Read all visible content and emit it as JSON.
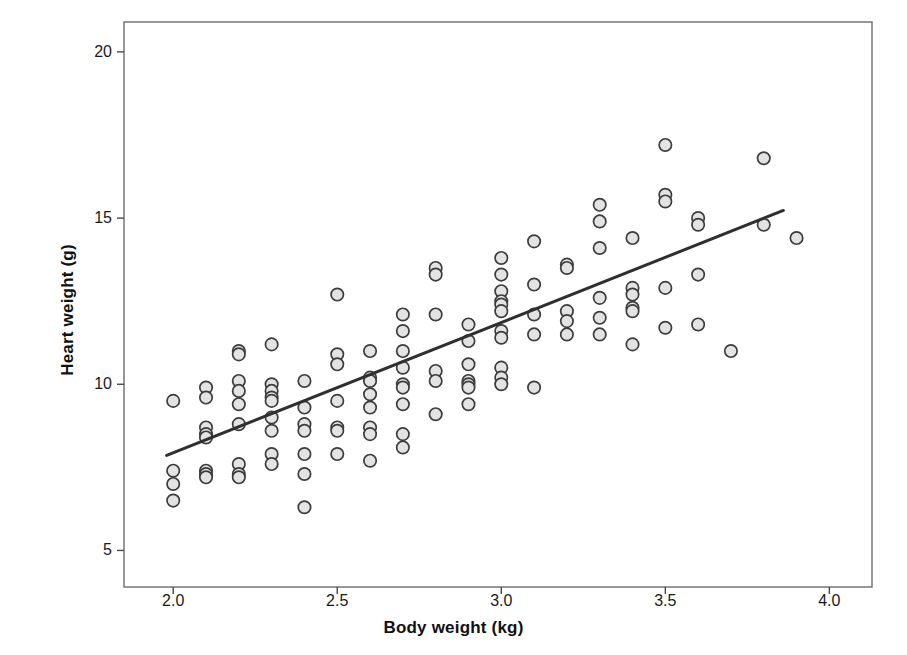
{
  "chart_data": {
    "type": "scatter",
    "title": "",
    "xlabel": "Body weight (kg)",
    "ylabel": "Heart weight (g)",
    "xlim": [
      1.85,
      4.13
    ],
    "ylim": [
      3.9,
      20.9
    ],
    "xticks": [
      "2.0",
      "2.5",
      "3.0",
      "3.5",
      "4.0"
    ],
    "xtick_values": [
      2.0,
      2.5,
      3.0,
      3.5,
      4.0
    ],
    "yticks": [
      "5",
      "10",
      "15",
      "20"
    ],
    "ytick_values": [
      5,
      10,
      15,
      20
    ],
    "grid": false,
    "legend": "none",
    "marker": {
      "shape": "circle",
      "fill": "#e3e3e3",
      "edge": "#3c3c3c",
      "radius": 6.2
    },
    "series": [
      {
        "name": "Cats: body weight vs heart weight",
        "points": [
          [
            2.0,
            9.5
          ],
          [
            2.0,
            7.4
          ],
          [
            2.0,
            7.0
          ],
          [
            2.0,
            6.5
          ],
          [
            2.1,
            9.9
          ],
          [
            2.1,
            9.6
          ],
          [
            2.1,
            8.7
          ],
          [
            2.1,
            8.5
          ],
          [
            2.1,
            8.4
          ],
          [
            2.1,
            7.4
          ],
          [
            2.1,
            7.3
          ],
          [
            2.1,
            7.2
          ],
          [
            2.2,
            11.0
          ],
          [
            2.2,
            10.9
          ],
          [
            2.2,
            10.1
          ],
          [
            2.2,
            9.8
          ],
          [
            2.2,
            9.4
          ],
          [
            2.2,
            8.8
          ],
          [
            2.2,
            7.6
          ],
          [
            2.2,
            7.3
          ],
          [
            2.2,
            7.2
          ],
          [
            2.3,
            11.2
          ],
          [
            2.3,
            10.0
          ],
          [
            2.3,
            9.8
          ],
          [
            2.3,
            9.6
          ],
          [
            2.3,
            9.5
          ],
          [
            2.3,
            9.0
          ],
          [
            2.3,
            8.6
          ],
          [
            2.3,
            7.9
          ],
          [
            2.3,
            7.6
          ],
          [
            2.4,
            10.1
          ],
          [
            2.4,
            9.3
          ],
          [
            2.4,
            8.8
          ],
          [
            2.4,
            8.6
          ],
          [
            2.4,
            7.9
          ],
          [
            2.4,
            7.3
          ],
          [
            2.4,
            6.3
          ],
          [
            2.5,
            12.7
          ],
          [
            2.5,
            10.9
          ],
          [
            2.5,
            10.6
          ],
          [
            2.5,
            9.5
          ],
          [
            2.5,
            8.7
          ],
          [
            2.5,
            8.6
          ],
          [
            2.5,
            7.9
          ],
          [
            2.6,
            11.0
          ],
          [
            2.6,
            10.2
          ],
          [
            2.6,
            10.1
          ],
          [
            2.6,
            9.7
          ],
          [
            2.6,
            9.3
          ],
          [
            2.6,
            8.7
          ],
          [
            2.6,
            8.5
          ],
          [
            2.6,
            7.7
          ],
          [
            2.7,
            12.1
          ],
          [
            2.7,
            11.6
          ],
          [
            2.7,
            11.0
          ],
          [
            2.7,
            10.5
          ],
          [
            2.7,
            10.0
          ],
          [
            2.7,
            9.9
          ],
          [
            2.7,
            9.4
          ],
          [
            2.7,
            8.5
          ],
          [
            2.7,
            8.1
          ],
          [
            2.8,
            13.5
          ],
          [
            2.8,
            13.3
          ],
          [
            2.8,
            12.1
          ],
          [
            2.8,
            10.4
          ],
          [
            2.8,
            10.1
          ],
          [
            2.8,
            9.1
          ],
          [
            2.9,
            11.8
          ],
          [
            2.9,
            11.3
          ],
          [
            2.9,
            10.6
          ],
          [
            2.9,
            10.1
          ],
          [
            2.9,
            10.0
          ],
          [
            2.9,
            9.9
          ],
          [
            2.9,
            9.4
          ],
          [
            3.0,
            13.8
          ],
          [
            3.0,
            13.3
          ],
          [
            3.0,
            12.8
          ],
          [
            3.0,
            12.5
          ],
          [
            3.0,
            12.4
          ],
          [
            3.0,
            12.2
          ],
          [
            3.0,
            11.6
          ],
          [
            3.0,
            11.4
          ],
          [
            3.0,
            10.5
          ],
          [
            3.0,
            10.2
          ],
          [
            3.0,
            10.0
          ],
          [
            3.1,
            14.3
          ],
          [
            3.1,
            13.0
          ],
          [
            3.1,
            12.1
          ],
          [
            3.1,
            11.5
          ],
          [
            3.1,
            9.9
          ],
          [
            3.2,
            13.6
          ],
          [
            3.2,
            13.5
          ],
          [
            3.2,
            12.2
          ],
          [
            3.2,
            11.9
          ],
          [
            3.2,
            11.5
          ],
          [
            3.3,
            15.4
          ],
          [
            3.3,
            14.9
          ],
          [
            3.3,
            14.1
          ],
          [
            3.3,
            12.6
          ],
          [
            3.3,
            12.0
          ],
          [
            3.3,
            11.5
          ],
          [
            3.4,
            14.4
          ],
          [
            3.4,
            12.9
          ],
          [
            3.4,
            12.7
          ],
          [
            3.4,
            12.3
          ],
          [
            3.4,
            12.2
          ],
          [
            3.4,
            11.2
          ],
          [
            3.5,
            17.2
          ],
          [
            3.5,
            15.7
          ],
          [
            3.5,
            15.5
          ],
          [
            3.5,
            12.9
          ],
          [
            3.5,
            11.7
          ],
          [
            3.6,
            15.0
          ],
          [
            3.6,
            14.8
          ],
          [
            3.6,
            13.3
          ],
          [
            3.6,
            11.8
          ],
          [
            3.7,
            11.0
          ],
          [
            3.8,
            16.8
          ],
          [
            3.8,
            14.8
          ],
          [
            3.9,
            14.4
          ]
        ]
      }
    ],
    "regression_line": {
      "label": "least-squares fit",
      "color": "#2f2f2f",
      "width": 3,
      "x_start": 1.98,
      "y_start": 7.86,
      "x_end": 3.86,
      "y_end": 15.23
    }
  }
}
